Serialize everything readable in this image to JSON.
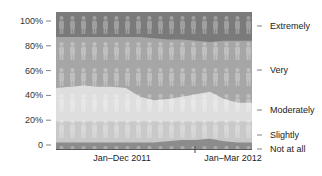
{
  "chart_data": {
    "type": "area",
    "stacked": true,
    "normalized": true,
    "title": "",
    "xlabel": "",
    "ylabel": "",
    "ylim": [
      0,
      100
    ],
    "y_ticks": [
      "0",
      "20%",
      "40%",
      "60%",
      "80%",
      "100%"
    ],
    "x_period_labels": [
      "Jan–Dec 2011",
      "Jan–Mar 2012"
    ],
    "grid": false,
    "legend_position": "right (inline labels)",
    "pictograph": "person-icon",
    "x": [
      0,
      1,
      2,
      3,
      4,
      5,
      6,
      7,
      8,
      9,
      10,
      11,
      12,
      13,
      14
    ],
    "series": [
      {
        "name": "Not at all",
        "color": "#8c8c8c",
        "values": [
          2,
          2,
          2,
          2,
          2,
          2,
          2,
          2,
          3,
          4,
          4,
          5,
          3,
          2,
          2
        ]
      },
      {
        "name": "Slightly",
        "color": "#c9c9c9",
        "values": [
          17,
          17,
          17,
          17,
          17,
          17,
          17,
          17,
          16,
          15,
          15,
          14,
          16,
          17,
          17
        ]
      },
      {
        "name": "Moderately",
        "color": "#dedede",
        "values": [
          27,
          28,
          29,
          28,
          28,
          27,
          20,
          17,
          18,
          20,
          22,
          24,
          18,
          15,
          15
        ]
      },
      {
        "name": "Very",
        "color": "#a6a6a6",
        "values": [
          41,
          40,
          39,
          40,
          40,
          41,
          48,
          50,
          48,
          46,
          43,
          40,
          47,
          50,
          50
        ]
      },
      {
        "name": "Extremely",
        "color": "#7a7a7a",
        "values": [
          13,
          13,
          13,
          13,
          13,
          13,
          13,
          14,
          15,
          15,
          16,
          17,
          16,
          16,
          16
        ]
      }
    ],
    "period_divider_at_x": 12
  },
  "axis": {
    "y_labels": [
      "100%",
      "80%",
      "60%",
      "40%",
      "20%",
      "0"
    ],
    "x_labels": [
      "Jan–Dec 2011",
      "Jan–Mar 2012"
    ]
  },
  "legend": {
    "items": [
      "Extremely",
      "Very",
      "Moderately",
      "Slightly",
      "Not at all"
    ]
  }
}
